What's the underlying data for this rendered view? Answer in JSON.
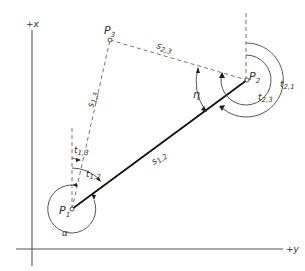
{
  "diagram": {
    "axes": {
      "x_label": "+x",
      "y_label": "+y"
    },
    "points": [
      {
        "id": "P1",
        "label": "P",
        "sub": "1"
      },
      {
        "id": "P2",
        "label": "P",
        "sub": "2"
      },
      {
        "id": "P3",
        "label": "P",
        "sub": "3"
      }
    ],
    "distances": [
      {
        "id": "s12",
        "label": "s",
        "sub": "1,2",
        "style": "solid"
      },
      {
        "id": "s13",
        "label": "s",
        "sub": "1,3",
        "style": "dashed"
      },
      {
        "id": "s23",
        "label": "s",
        "sub": "2,3",
        "style": "dashed"
      }
    ],
    "angles": [
      {
        "id": "t13",
        "label": "t",
        "sub": "1,3"
      },
      {
        "id": "t12",
        "label": "t",
        "sub": "1,2"
      },
      {
        "id": "t21",
        "label": "t",
        "sub": "2,1"
      },
      {
        "id": "t23",
        "label": "t",
        "sub": "2,3"
      },
      {
        "id": "eta",
        "label": "η"
      },
      {
        "id": "alpha",
        "label": "α"
      }
    ],
    "colors": {
      "line": "#111111",
      "dashed": "#666666",
      "text": "#333333",
      "background": "#ffffff"
    }
  }
}
